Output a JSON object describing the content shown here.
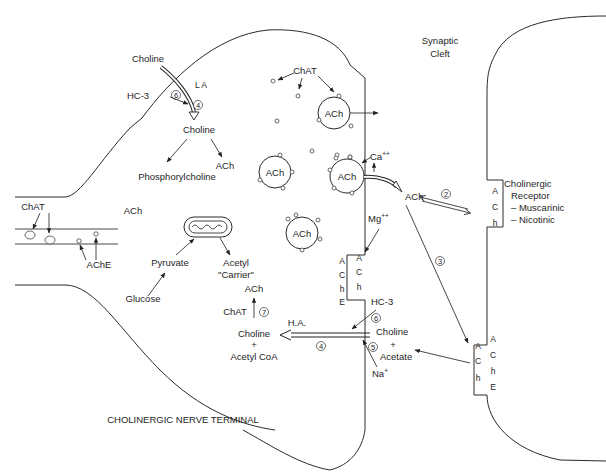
{
  "title": "Cholinergic Nerve Terminal",
  "regions": {
    "synaptic_cleft": "Synaptic Cleft",
    "synaptic_cleft_lines": [
      "Synaptic",
      "Cleft"
    ],
    "terminal_label": "CHOLINERGIC NERVE TERMINAL"
  },
  "axon": {
    "chat": "ChAT",
    "ach": "ACh",
    "ache": "AChE"
  },
  "uptake_top": {
    "choline_out": "Choline",
    "la": "L A",
    "hc3": "HC-3",
    "step6": "6",
    "step4": "4",
    "choline_in": "Choline",
    "phosphorylcholine": "Phosphorylcholine",
    "ach": "ACh"
  },
  "metabolism": {
    "pyruvate": "Pyruvate",
    "glucose": "Glucose",
    "acetyl_carrier_line1": "Acetyl",
    "acetyl_carrier_line2": "\"Carrier\""
  },
  "vesicles": {
    "chat": "ChAT",
    "labels": [
      "ACh",
      "ACh",
      "ACh",
      "ACh"
    ]
  },
  "release": {
    "ca": "Ca",
    "ca_sup": "++",
    "ach_cleft": "ACh",
    "mg": "Mg",
    "mg_sup": "++",
    "step2": "2",
    "step3": "3"
  },
  "presynaptic_ache_outer": [
    "A",
    "C",
    "h",
    "E"
  ],
  "presynaptic_ache_inner": [
    "A",
    "C",
    "h"
  ],
  "receptor": {
    "letters": [
      "A",
      "C",
      "h"
    ],
    "title_line1": "Cholinergic",
    "title_line2": "Receptor",
    "types": [
      "– Muscarinic",
      "– Nicotinic"
    ]
  },
  "postsynaptic_ache_inner": [
    "A",
    "C",
    "h"
  ],
  "postsynaptic_ache_outer": [
    "A",
    "C",
    "h",
    "E"
  ],
  "reuptake": {
    "ach": "ACh",
    "chat": "ChAT",
    "step7": "7",
    "ha": "H.A.",
    "choline_in": "Choline",
    "plus": "+",
    "acetyl_coa": "Acetyl  CoA",
    "step4": "4",
    "hc3": "HC-3",
    "step6": "6",
    "choline_out": "Choline",
    "step5": "5",
    "acetate": "Acetate",
    "na": "Na",
    "na_sup": "+"
  },
  "colors": {
    "line": "#2a2a2a",
    "text": "#1e1e1e",
    "background": "#ffffff"
  }
}
